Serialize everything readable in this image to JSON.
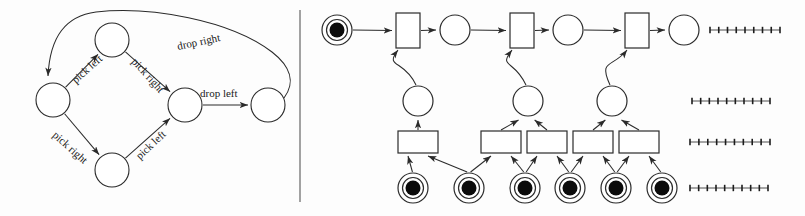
{
  "figure": {
    "divider": {
      "x": 300,
      "y1": 10,
      "y2": 202
    }
  },
  "transition_system": {
    "name": "pick-drop transition system",
    "nodes": [
      {
        "id": "s0",
        "cx": 53,
        "cy": 100,
        "r": 17
      },
      {
        "id": "s1",
        "cx": 112,
        "cy": 40,
        "r": 17
      },
      {
        "id": "s2",
        "cx": 112,
        "cy": 170,
        "r": 17
      },
      {
        "id": "s3",
        "cx": 185,
        "cy": 105,
        "r": 17
      },
      {
        "id": "s4",
        "cx": 268,
        "cy": 105,
        "r": 17
      }
    ],
    "labels": [
      {
        "id": "pick-left-upper",
        "text": "pick left",
        "x": 76,
        "y": 84,
        "rotate": -42
      },
      {
        "id": "pick-right-upper",
        "text": "pick right",
        "x": 131,
        "y": 62,
        "rotate": 48
      },
      {
        "id": "pick-right-lower",
        "text": "pick right",
        "x": 52,
        "y": 136,
        "rotate": 42
      },
      {
        "id": "pick-left-lower",
        "text": "pick left",
        "x": 140,
        "y": 160,
        "rotate": -43
      },
      {
        "id": "drop-left",
        "text": "drop left",
        "x": 200,
        "y": 97,
        "rotate": 0
      },
      {
        "id": "drop-right",
        "text": "drop right",
        "x": 178,
        "y": 50,
        "rotate": -12
      }
    ]
  },
  "petri_net": {
    "name": "unfolded occurrence net",
    "top_places": [
      {
        "id": "p-top-0",
        "cx": 337,
        "cy": 30,
        "r": 15,
        "token": true
      },
      {
        "id": "p-top-1",
        "cx": 455,
        "cy": 30,
        "r": 15,
        "token": false
      },
      {
        "id": "p-top-2",
        "cx": 568,
        "cy": 30,
        "r": 15,
        "token": false
      },
      {
        "id": "p-top-3",
        "cx": 684,
        "cy": 30,
        "r": 15,
        "token": false
      }
    ],
    "top_transitions": [
      {
        "id": "t-top-0",
        "x": 396,
        "y": 13,
        "w": 24,
        "h": 35
      },
      {
        "id": "t-top-1",
        "x": 510,
        "y": 13,
        "w": 24,
        "h": 35
      },
      {
        "id": "t-top-2",
        "x": 625,
        "y": 13,
        "w": 24,
        "h": 35
      }
    ],
    "mid_places": [
      {
        "id": "p-mid-0",
        "cx": 418,
        "cy": 101,
        "r": 15,
        "token": false
      },
      {
        "id": "p-mid-1",
        "cx": 528,
        "cy": 101,
        "r": 15,
        "token": false
      },
      {
        "id": "p-mid-2",
        "cx": 612,
        "cy": 101,
        "r": 15,
        "token": false
      }
    ],
    "mid_transitions": [
      {
        "id": "t-mid-0",
        "x": 398,
        "y": 131,
        "w": 40,
        "h": 22
      },
      {
        "id": "t-mid-1",
        "x": 481,
        "y": 131,
        "w": 40,
        "h": 22
      },
      {
        "id": "t-mid-2",
        "x": 527,
        "y": 131,
        "w": 40,
        "h": 22
      },
      {
        "id": "t-mid-3",
        "x": 573,
        "y": 131,
        "w": 40,
        "h": 22
      },
      {
        "id": "t-mid-4",
        "x": 619,
        "y": 131,
        "w": 40,
        "h": 22
      }
    ],
    "bottom_places": [
      {
        "id": "p-bot-0",
        "cx": 413,
        "cy": 188,
        "r": 15,
        "token": true
      },
      {
        "id": "p-bot-1",
        "cx": 469,
        "cy": 188,
        "r": 15,
        "token": true
      },
      {
        "id": "p-bot-2",
        "cx": 525,
        "cy": 188,
        "r": 15,
        "token": true
      },
      {
        "id": "p-bot-3",
        "cx": 570,
        "cy": 188,
        "r": 15,
        "token": true
      },
      {
        "id": "p-bot-4",
        "cx": 616,
        "cy": 188,
        "r": 15,
        "token": true
      },
      {
        "id": "p-bot-5",
        "cx": 662,
        "cy": 188,
        "r": 15,
        "token": true
      }
    ],
    "continuation_marks": [
      {
        "id": "ellipsis-row-0",
        "x1": 710,
        "x2": 780,
        "y": 30,
        "ticks": 9
      },
      {
        "id": "ellipsis-row-1",
        "x1": 692,
        "x2": 770,
        "y": 101,
        "ticks": 10
      },
      {
        "id": "ellipsis-row-2",
        "x1": 690,
        "x2": 770,
        "y": 142,
        "ticks": 10
      },
      {
        "id": "ellipsis-row-3",
        "x1": 690,
        "x2": 768,
        "y": 188,
        "ticks": 10
      }
    ]
  }
}
